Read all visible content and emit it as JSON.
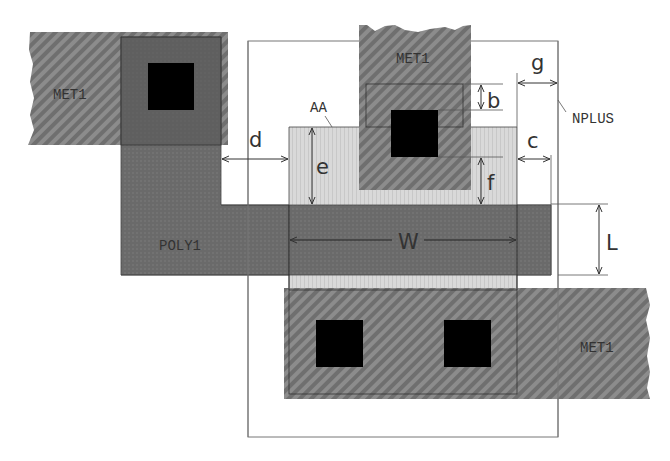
{
  "diagram": {
    "layers": {
      "met1_left": "MET1",
      "met1_top": "MET1",
      "met1_bottom": "MET1",
      "active_area": "AA",
      "poly": "POLY1",
      "nplus": "NPLUS"
    },
    "dimensions": {
      "b": "b",
      "c": "c",
      "d": "d",
      "e": "e",
      "f": "f",
      "g": "g",
      "W": "W",
      "L": "L"
    },
    "colors": {
      "metal": "#6e6e6e",
      "metal_stripe": "#8a8a8a",
      "poly": "#6a6a6a",
      "active": "#d6d6d6",
      "contact": "#000000",
      "line": "#333333"
    }
  }
}
